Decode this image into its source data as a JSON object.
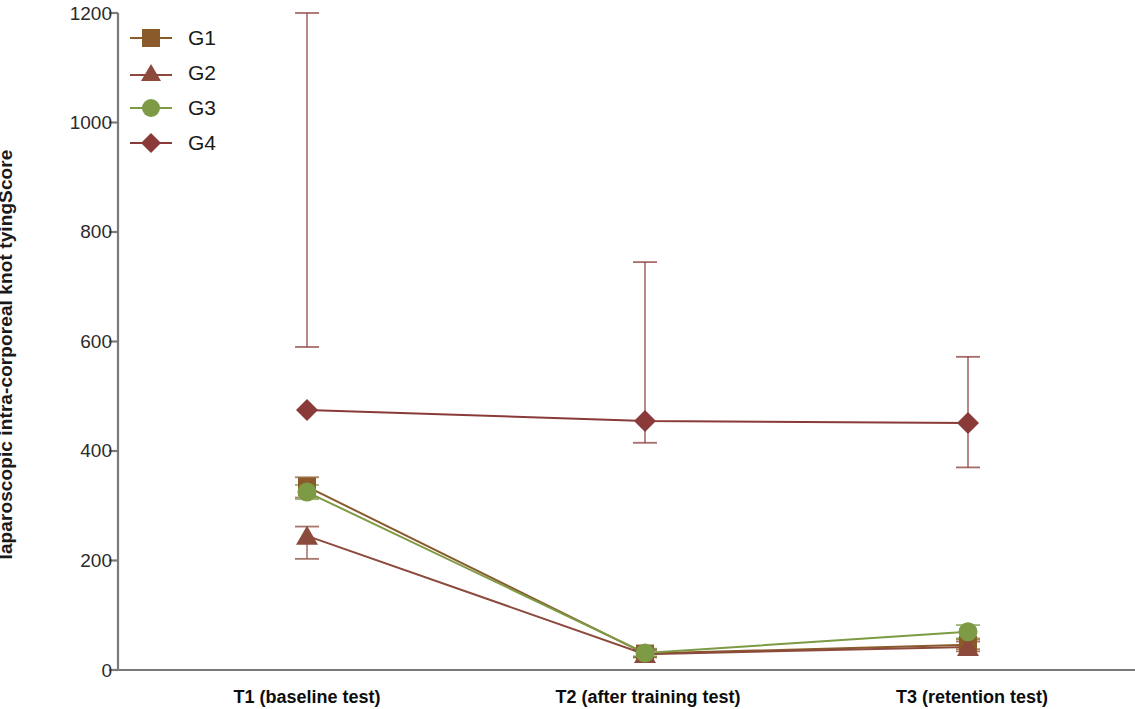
{
  "chart_data": {
    "type": "line",
    "title": "",
    "subtitle": "",
    "xlabel": "",
    "ylabel": "Score",
    "ylabel_line2": "laparoscopic intra-corporeal knot tying",
    "categories": [
      "T1 (baseline test)",
      "T2 (after training test)",
      "T3 (retention test)"
    ],
    "ylim": [
      0,
      1200
    ],
    "yticks": [
      0,
      200,
      400,
      600,
      800,
      1000,
      1200
    ],
    "ytick_labels": [
      "0",
      "200",
      "400",
      "600",
      "800",
      "1000",
      "1200"
    ],
    "grid": false,
    "legend_position": "top-left",
    "error_bars": "vertical-caps",
    "series": [
      {
        "name": "G1",
        "marker": "square",
        "color": "#8a5a2b",
        "values": [
          335,
          30,
          46
        ],
        "err_low": [
          315,
          24,
          38
        ],
        "err_high": [
          352,
          38,
          56
        ]
      },
      {
        "name": "G2",
        "marker": "triangle",
        "color": "#8c4a3c",
        "values": [
          245,
          29,
          42
        ],
        "err_low": [
          203,
          23,
          34
        ],
        "err_high": [
          262,
          36,
          52
        ]
      },
      {
        "name": "G3",
        "marker": "circle",
        "color": "#7d9a45",
        "values": [
          325,
          31,
          70
        ],
        "err_low": [
          312,
          25,
          58
        ],
        "err_high": [
          338,
          39,
          82
        ]
      },
      {
        "name": "G4",
        "marker": "diamond",
        "color": "#8a3a38",
        "values": [
          475,
          455,
          451
        ],
        "err_low": [
          590,
          415,
          370
        ],
        "err_high": [
          1200,
          745,
          572
        ]
      }
    ]
  },
  "legend": {
    "items": [
      {
        "label": "G1"
      },
      {
        "label": "G2"
      },
      {
        "label": "G3"
      },
      {
        "label": "G4"
      }
    ]
  },
  "axes": {
    "y_tick_0": "0",
    "y_tick_1": "200",
    "y_tick_2": "400",
    "y_tick_3": "600",
    "y_tick_4": "800",
    "y_tick_5": "1000",
    "y_tick_6": "1200",
    "x_tick_0": "T1 (baseline test)",
    "x_tick_1": "T2 (after training test)",
    "x_tick_2": "T3 (retention test)",
    "y_axis_title": "Score",
    "y_axis_subtitle": "laparoscopic intra-corporeal knot tying"
  },
  "colors": {
    "g1": "#8a5a2b",
    "g2": "#8c4a3c",
    "g3": "#7d9a45",
    "g4": "#8a3a38",
    "axis": "#7a7a7a",
    "text": "#1a1a1a"
  }
}
